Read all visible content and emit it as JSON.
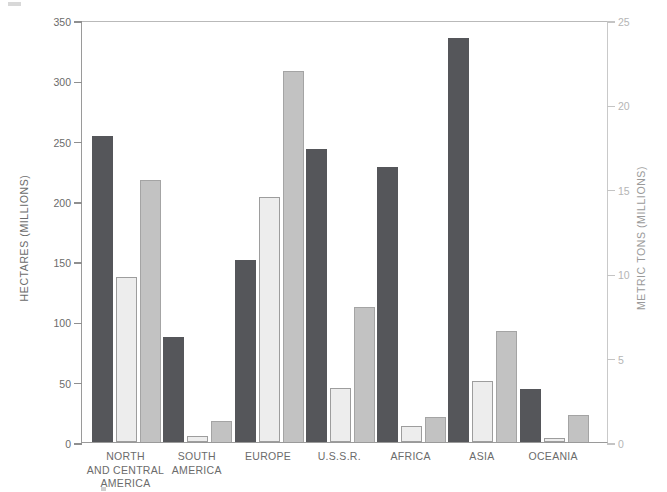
{
  "chart_data": {
    "type": "bar",
    "title": "",
    "categories": [
      "NORTH AND CENTRAL AMERICA",
      "SOUTH AMERICA",
      "EUROPE",
      "U.S.S.R.",
      "AFRICA",
      "ASIA",
      "OCEANIA"
    ],
    "category_lines": [
      [
        "NORTH",
        "AND CENTRAL",
        "AMERICA"
      ],
      [
        "SOUTH",
        "AMERICA"
      ],
      [
        "EUROPE"
      ],
      [
        "U.S.S.R."
      ],
      [
        "AFRICA"
      ],
      [
        "ASIA"
      ],
      [
        "OCEANIA"
      ]
    ],
    "series": [
      {
        "name": "series-1",
        "axis": "left",
        "color": "#55565a",
        "values": [
          254,
          87,
          151,
          243,
          228,
          335,
          44
        ]
      },
      {
        "name": "series-2",
        "axis": "right",
        "color": "#ededed",
        "values": [
          9.8,
          0.35,
          14.5,
          3.2,
          0.95,
          3.6,
          0.25
        ]
      },
      {
        "name": "series-3",
        "axis": "right",
        "color": "#c2c2c2",
        "values": [
          15.5,
          1.25,
          22.0,
          8.0,
          1.5,
          6.6,
          1.6
        ]
      }
    ],
    "left_axis": {
      "label": "HECTARES (MILLIONS)",
      "ticks": [
        0,
        50,
        100,
        150,
        200,
        250,
        300,
        350
      ],
      "tick_labels": [
        "0",
        "50",
        "100",
        "150",
        "200",
        "250",
        "300",
        "350"
      ],
      "min": 0,
      "max": 350
    },
    "right_axis": {
      "label": "METRIC TONS (MILLIONS)",
      "ticks": [
        0,
        5,
        10,
        15,
        20,
        25
      ],
      "tick_labels": [
        "0",
        "5",
        "10",
        "15",
        "20",
        "25"
      ],
      "min": 0,
      "max": 25
    },
    "grid": false,
    "legend": null,
    "xlabel": "",
    "ylabel": "HECTARES (MILLIONS)"
  }
}
